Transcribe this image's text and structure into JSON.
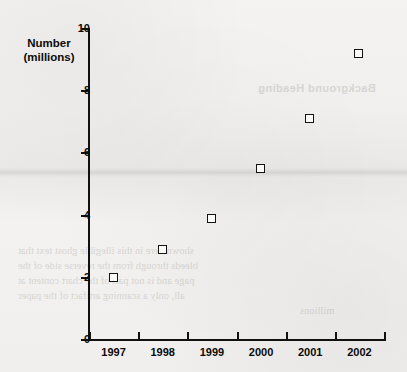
{
  "chart_data": {
    "type": "scatter",
    "title": "",
    "subtitle": "",
    "xlabel": "",
    "ylabel": "Number (millions)",
    "ylabel_line1": "Number",
    "ylabel_line2": "(millions)",
    "categories": [
      "1997",
      "1998",
      "1999",
      "2000",
      "2001",
      "2002"
    ],
    "values": [
      2.0,
      2.9,
      3.9,
      5.5,
      7.1,
      9.2
    ],
    "points": [
      {
        "x": "1997",
        "y": 2.0
      },
      {
        "x": "1998",
        "y": 2.9
      },
      {
        "x": "1999",
        "y": 3.9
      },
      {
        "x": "2000",
        "y": 5.5
      },
      {
        "x": "2001",
        "y": 7.1
      },
      {
        "x": "2002",
        "y": 9.2
      }
    ],
    "ylim": [
      0,
      10
    ],
    "y_ticks": [
      0,
      2,
      4,
      6,
      8,
      10
    ],
    "y_tick_labels": [
      "0",
      "2",
      "4",
      "6",
      "8",
      "10"
    ],
    "x_tick_labels": [
      "1997",
      "1998",
      "1999",
      "2000",
      "2001",
      "2002"
    ],
    "grid": false,
    "legend": null,
    "legend_position": "none",
    "marker_style": "open-square",
    "marker_color": "#131313",
    "marker_fill": "#fbfbfa",
    "axis_color": "#111111",
    "background_color": "#f2f1ef"
  },
  "background_text": {
    "heading": "Background Heading",
    "lines": [
      "shown here in this illegible ghost text that",
      "bleeds through from the reverse side of the",
      "page and is not part of the chart content at",
      "all, only a scanning artifact of the paper",
      "millions"
    ]
  }
}
